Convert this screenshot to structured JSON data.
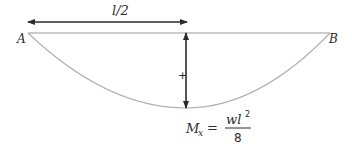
{
  "diagram": {
    "type": "bending-moment-diagram",
    "supports": {
      "left_label": "A",
      "right_label": "B"
    },
    "dimension": {
      "label": "l/2"
    },
    "sign": "+",
    "formula": {
      "lhs_main": "M",
      "lhs_sub": "x",
      "equals": "=",
      "numerator_base": "wl",
      "numerator_exp": "2",
      "denominator": "8"
    },
    "colors": {
      "beam_line": "#9a9a9a",
      "curve": "#b0b0b0",
      "arrow": "#2b2b2b",
      "text": "#2b2b2b"
    }
  }
}
